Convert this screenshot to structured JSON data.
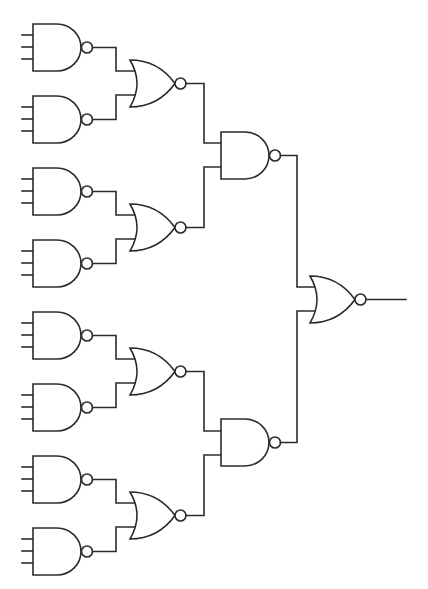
{
  "diagram": {
    "type": "logic-circuit",
    "colors": {
      "line": "#2b2b2b",
      "background": "#ffffff",
      "gate_fill": "#ffffff"
    },
    "levels": [
      {
        "level": 1,
        "gate": "NAND",
        "inputs_per_gate": 3,
        "count": 8
      },
      {
        "level": 2,
        "gate": "NOR",
        "inputs_per_gate": 2,
        "count": 4
      },
      {
        "level": 3,
        "gate": "NAND",
        "inputs_per_gate": 2,
        "count": 2
      },
      {
        "level": 4,
        "gate": "NOR",
        "inputs_per_gate": 2,
        "count": 1
      }
    ],
    "gates": [
      {
        "id": "nand1",
        "type": "NAND",
        "inputs": 3,
        "top": 24,
        "feeds": "nor1"
      },
      {
        "id": "nand2",
        "type": "NAND",
        "inputs": 3,
        "top": 96,
        "feeds": "nor1"
      },
      {
        "id": "nand3",
        "type": "NAND",
        "inputs": 3,
        "top": 168,
        "feeds": "nor2"
      },
      {
        "id": "nand4",
        "type": "NAND",
        "inputs": 3,
        "top": 240,
        "feeds": "nor2"
      },
      {
        "id": "nand5",
        "type": "NAND",
        "inputs": 3,
        "top": 312,
        "feeds": "nor3"
      },
      {
        "id": "nand6",
        "type": "NAND",
        "inputs": 3,
        "top": 384,
        "feeds": "nor3"
      },
      {
        "id": "nand7",
        "type": "NAND",
        "inputs": 3,
        "top": 456,
        "feeds": "nor4"
      },
      {
        "id": "nand8",
        "type": "NAND",
        "inputs": 3,
        "top": 528,
        "feeds": "nor4"
      },
      {
        "id": "nor1",
        "type": "NOR",
        "inputs": 2,
        "top": 60,
        "feeds": "nand9"
      },
      {
        "id": "nor2",
        "type": "NOR",
        "inputs": 2,
        "top": 204,
        "feeds": "nand9"
      },
      {
        "id": "nor3",
        "type": "NOR",
        "inputs": 2,
        "top": 348,
        "feeds": "nand10"
      },
      {
        "id": "nor4",
        "type": "NOR",
        "inputs": 2,
        "top": 492,
        "feeds": "nand10"
      },
      {
        "id": "nand9",
        "type": "NAND",
        "inputs": 2,
        "top": 132,
        "feeds": "nor5"
      },
      {
        "id": "nand10",
        "type": "NAND",
        "inputs": 2,
        "top": 419,
        "feeds": "nor5"
      },
      {
        "id": "nor5",
        "type": "NOR",
        "inputs": 2,
        "top": 276,
        "feeds": "output"
      }
    ]
  }
}
